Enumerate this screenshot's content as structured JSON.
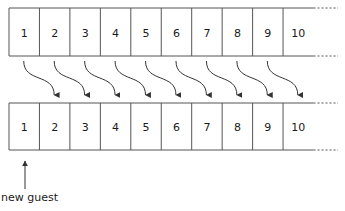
{
  "diagram": {
    "top_row": {
      "cells": [
        "1",
        "2",
        "3",
        "4",
        "5",
        "6",
        "7",
        "8",
        "9",
        "10"
      ],
      "continues": true
    },
    "bottom_row": {
      "cells": [
        "1",
        "2",
        "3",
        "4",
        "5",
        "6",
        "7",
        "8",
        "9",
        "10"
      ],
      "continues": true
    },
    "shift_arrows": {
      "count": 9,
      "description": "each guest moves from room n to room n+1"
    },
    "new_guest": {
      "label": "new guest",
      "target_room": "1"
    },
    "colors": {
      "line": "#555555",
      "arrow": "#333333",
      "text": "#1a1a1a",
      "background": "#ffffff"
    }
  }
}
